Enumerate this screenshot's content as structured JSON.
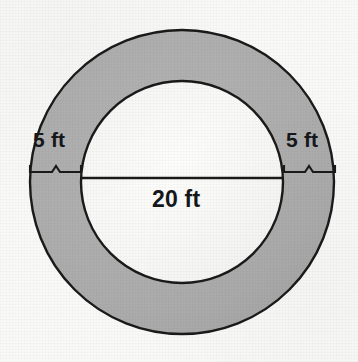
{
  "figure": {
    "type": "annulus-diagram",
    "background_color": "#f9f9f8",
    "ring_fill_color": "#ababab",
    "inner_fill_color": "#fbfbfa",
    "stroke_color": "#1a1a1a",
    "outer_circle": {
      "center_x": 182,
      "center_y": 182,
      "radius": 152
    },
    "inner_circle": {
      "center_x": 182,
      "center_y": 182,
      "radius": 101
    },
    "diameter_line": {
      "x1": 81,
      "y1": 178,
      "x2": 284,
      "y2": 178
    },
    "labels": {
      "left_width": "5 ft",
      "right_width": "5 ft",
      "inner_diameter": "20 ft"
    },
    "braces": {
      "left": {
        "x1": 30,
        "x2": 81,
        "y": 172
      },
      "right": {
        "x1": 284,
        "x2": 335,
        "y": 172
      }
    }
  }
}
